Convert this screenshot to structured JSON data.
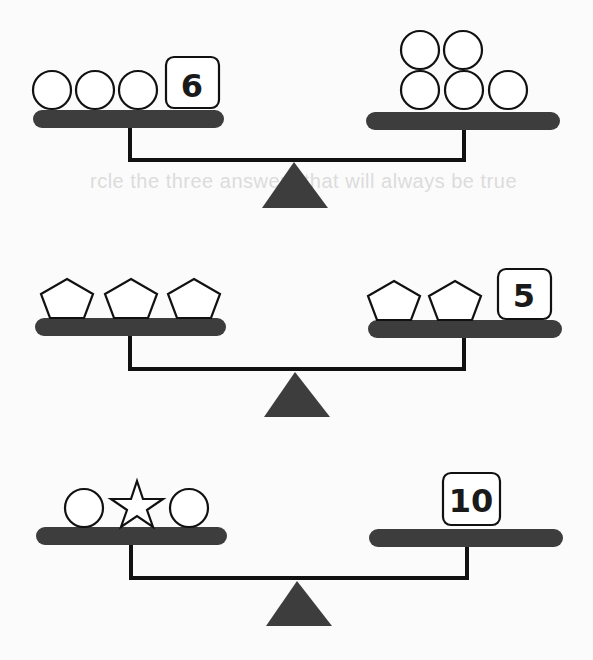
{
  "background_text": "rcle the three answers that will always be true",
  "colors": {
    "pan": "#3d3d3d",
    "fulcrum": "#3d3d3d",
    "beam": "#111111",
    "shape_stroke": "#111111",
    "shape_fill": "#ffffff"
  },
  "balances": [
    {
      "left": {
        "items": [
          "circle",
          "circle",
          "circle"
        ],
        "number": "6"
      },
      "right": {
        "items": [
          "circle",
          "circle",
          "circle",
          "circle",
          "circle"
        ],
        "number": null
      }
    },
    {
      "left": {
        "items": [
          "pentagon",
          "pentagon",
          "pentagon"
        ],
        "number": null
      },
      "right": {
        "items": [
          "pentagon",
          "pentagon"
        ],
        "number": "5"
      }
    },
    {
      "left": {
        "items": [
          "circle",
          "star",
          "circle"
        ],
        "number": null
      },
      "right": {
        "items": [],
        "number": "10"
      }
    }
  ]
}
